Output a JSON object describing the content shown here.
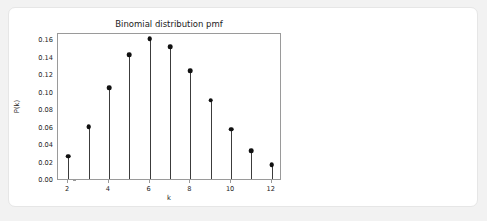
{
  "card": {
    "background": "#ffffff",
    "border_color": "#e6e6e6"
  },
  "page": {
    "background": "#f2f2f2"
  },
  "chart_data": {
    "type": "line",
    "plot_style": "stem",
    "title": "Binomial distribution pmf",
    "xlabel": "k",
    "ylabel": "P(k)",
    "categories": [
      2,
      3,
      4,
      5,
      6,
      7,
      8,
      9,
      10,
      11,
      12
    ],
    "x": [
      2,
      3,
      4,
      5,
      6,
      7,
      8,
      9,
      10,
      11,
      12
    ],
    "values": [
      0.026,
      0.06,
      0.104,
      0.142,
      0.16,
      0.151,
      0.124,
      0.09,
      0.057,
      0.032,
      0.016
    ],
    "xlim": [
      1.5,
      12.5
    ],
    "ylim": [
      0.0,
      0.168
    ],
    "xticks": [
      2,
      4,
      6,
      8,
      10,
      12
    ],
    "xticklabels": [
      "2",
      "4",
      "6",
      "8",
      "10",
      "12"
    ],
    "yticks": [
      0.0,
      0.02,
      0.04,
      0.06,
      0.08,
      0.1,
      0.12,
      0.14,
      0.16
    ],
    "yticklabels": [
      "0.00",
      "0.02",
      "0.04",
      "0.06",
      "0.08",
      "0.10",
      "0.12",
      "0.14",
      "0.16"
    ],
    "grid": false,
    "legend": null,
    "marker_color": "#111111",
    "stem_color": "#3c3c3c",
    "frame_color": "#9a9a9a"
  }
}
